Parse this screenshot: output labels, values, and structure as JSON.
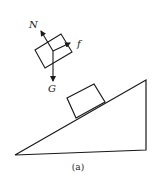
{
  "figure": {
    "caption": "(a)",
    "free_body_diagram": {
      "labels": {
        "normal_force": "N",
        "friction_force": "f",
        "gravity_force": "G"
      }
    },
    "incline": {
      "description": "block resting on inclined plane (right triangle)"
    },
    "colors": {
      "line": "#1a1a1a",
      "background": "#ffffff"
    }
  }
}
